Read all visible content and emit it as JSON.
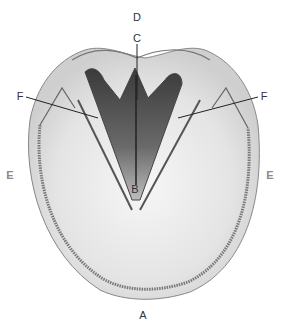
{
  "diagram": {
    "labels": [
      {
        "id": "A",
        "text": "A",
        "x": 143,
        "y": 315
      },
      {
        "id": "B",
        "text": "B",
        "x": 135,
        "y": 189
      },
      {
        "id": "C",
        "text": "C",
        "x": 137,
        "y": 38
      },
      {
        "id": "D",
        "text": "D",
        "x": 137,
        "y": 17
      },
      {
        "id": "E-left",
        "text": "E",
        "x": 10,
        "y": 175
      },
      {
        "id": "E-right",
        "text": "E",
        "x": 270,
        "y": 175
      },
      {
        "id": "F-left",
        "text": "F",
        "x": 20,
        "y": 96
      },
      {
        "id": "F-right",
        "text": "F",
        "x": 264,
        "y": 96
      }
    ],
    "colors": {
      "outline": "#555555",
      "frog_dark": "#3a3a3a",
      "sole": "#e6e6e6",
      "white_line": "#777777",
      "background": "#ffffff"
    }
  }
}
